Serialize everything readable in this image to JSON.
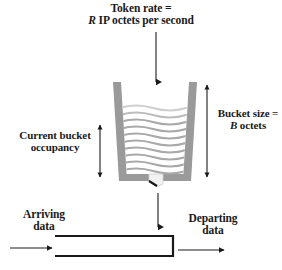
{
  "figure": {
    "colors": {
      "ink": "#1a1a1a",
      "bucket_wall": "#9a9a9a",
      "bucket_fill_line": "#a8a8a8",
      "background": "#ffffff"
    }
  },
  "labels": {
    "token_rate": {
      "line1": "Token rate =",
      "var": "R",
      "line2_rest": " IP octets per second"
    },
    "bucket_size": {
      "line1": "Bucket size =",
      "var": "B",
      "line2_rest": " octets"
    },
    "occupancy": {
      "line1": "Current bucket",
      "line2": "occupancy"
    },
    "arriving": {
      "line1": "Arriving",
      "line2": "data"
    },
    "departing": {
      "line1": "Departing",
      "line2": "data"
    }
  },
  "elements": {
    "token_rate_arrow": "downward arrow into bucket",
    "bucket": "trapezoidal token bucket with wavy fill",
    "bucket_spout": "outlet nozzle at bucket bottom",
    "occupancy_arrow": "vertical double-headed arrow, current fill level",
    "bucket_size_arrow": "vertical double-headed arrow, total bucket height",
    "token_flow_arrow": "downward arrow from bucket to data pipe",
    "data_pipe": "horizontal data pipe open at left",
    "arriving_arrow": "rightward arrow into pipe",
    "departing_arrow": "rightward arrow out of pipe"
  }
}
